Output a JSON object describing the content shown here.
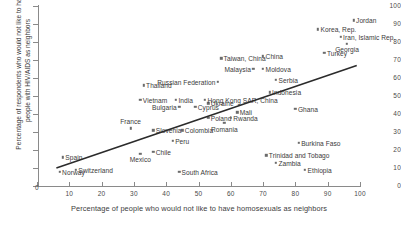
{
  "chart_data": {
    "type": "scatter",
    "title": "",
    "xlabel": "Percentage of people who would not like to have homosexuals as neighbors",
    "ylabel": "Percentage of respondents who would not like to have people with HIV/AIDS as neighbors",
    "xlim": [
      0,
      100
    ],
    "ylim": [
      0,
      100
    ],
    "xticks": [
      0,
      10,
      20,
      30,
      40,
      50,
      60,
      70,
      80,
      90,
      100
    ],
    "yticks": [
      0,
      10,
      20,
      30,
      40,
      50,
      60,
      70,
      80,
      90,
      100
    ],
    "grid": false,
    "legend": "none",
    "marker_color": "#6b6b6b",
    "trendline": {
      "show": true,
      "color": "#2b2b2b",
      "x_start": 6,
      "y_start": 10,
      "x_end": 99,
      "y_end": 67
    },
    "points": [
      {
        "label": "Norway",
        "x": 7,
        "y": 8,
        "pos": "right"
      },
      {
        "label": "Spain",
        "x": 8,
        "y": 16,
        "pos": "right"
      },
      {
        "label": "Switzerland",
        "x": 12,
        "y": 9,
        "pos": "right"
      },
      {
        "label": "France",
        "x": 29,
        "y": 32,
        "pos": "above"
      },
      {
        "label": "Vietnam",
        "x": 32,
        "y": 48,
        "pos": "right"
      },
      {
        "label": "Thailand",
        "x": 33,
        "y": 56,
        "pos": "right"
      },
      {
        "label": "Mexico",
        "x": 32,
        "y": 18,
        "pos": "below"
      },
      {
        "label": "Chile",
        "x": 36,
        "y": 19,
        "pos": "right"
      },
      {
        "label": "Slovenia",
        "x": 36,
        "y": 31,
        "pos": "right"
      },
      {
        "label": "South Africa",
        "x": 44,
        "y": 8,
        "pos": "right"
      },
      {
        "label": "Bulgaria",
        "x": 44,
        "y": 44,
        "pos": "left"
      },
      {
        "label": "India",
        "x": 43,
        "y": 48,
        "pos": "right"
      },
      {
        "label": "Peru",
        "x": 42,
        "y": 25,
        "pos": "right"
      },
      {
        "label": "Colombia",
        "x": 45,
        "y": 31,
        "pos": "right"
      },
      {
        "label": "Cyprus",
        "x": 49,
        "y": 44,
        "pos": "right"
      },
      {
        "label": "Ukraine",
        "x": 53,
        "y": 46,
        "pos": "right"
      },
      {
        "label": "Hong Kong SAR, China",
        "x": 52,
        "y": 48,
        "pos": "right"
      },
      {
        "label": "Poland",
        "x": 53,
        "y": 38,
        "pos": "right"
      },
      {
        "label": "Romania",
        "x": 58,
        "y": 35,
        "pos": "below"
      },
      {
        "label": "Rwanda",
        "x": 60,
        "y": 38,
        "pos": "right"
      },
      {
        "label": "Mali",
        "x": 62,
        "y": 41,
        "pos": "right"
      },
      {
        "label": "Russian Federation",
        "x": 56,
        "y": 58,
        "pos": "left"
      },
      {
        "label": "Taiwan, China",
        "x": 57,
        "y": 71,
        "pos": "right"
      },
      {
        "label": "China",
        "x": 70,
        "y": 72,
        "pos": "right"
      },
      {
        "label": "Malaysia",
        "x": 67,
        "y": 65,
        "pos": "left"
      },
      {
        "label": "Moldova",
        "x": 70,
        "y": 65,
        "pos": "right"
      },
      {
        "label": "Serbia",
        "x": 74,
        "y": 59,
        "pos": "right"
      },
      {
        "label": "Indonesia",
        "x": 72,
        "y": 52,
        "pos": "right"
      },
      {
        "label": "Ghana",
        "x": 80,
        "y": 43,
        "pos": "right"
      },
      {
        "label": "Burkina Faso",
        "x": 81,
        "y": 24,
        "pos": "right"
      },
      {
        "label": "Trinidad and Tobago",
        "x": 71,
        "y": 17,
        "pos": "right"
      },
      {
        "label": "Zambia",
        "x": 74,
        "y": 13,
        "pos": "right"
      },
      {
        "label": "Ethiopia",
        "x": 83,
        "y": 9,
        "pos": "right"
      },
      {
        "label": "Turkey",
        "x": 89,
        "y": 74,
        "pos": "right"
      },
      {
        "label": "Korea, Rep.",
        "x": 87,
        "y": 87,
        "pos": "right"
      },
      {
        "label": "Iran, Islamic Rep.",
        "x": 94,
        "y": 83,
        "pos": "right"
      },
      {
        "label": "Georgia",
        "x": 96,
        "y": 79,
        "pos": "below"
      },
      {
        "label": "Jordan",
        "x": 98,
        "y": 92,
        "pos": "right"
      }
    ]
  }
}
